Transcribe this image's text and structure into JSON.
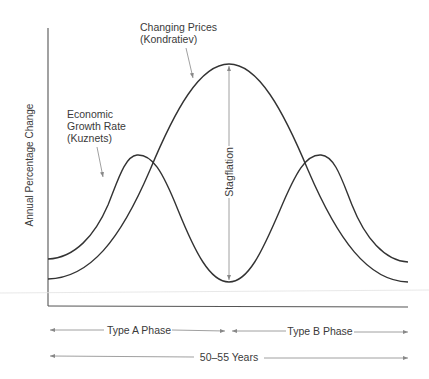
{
  "diagram": {
    "y_axis_label": "Annual Percentage Change",
    "labels": {
      "kondratiev_line1": "Changing Prices",
      "kondratiev_line2": "(Kondratiev)",
      "kuznets_line1": "Economic",
      "kuznets_line2": "Growth Rate",
      "kuznets_line3": "(Kuznets)",
      "stagflation": "Stagflation"
    },
    "phases": {
      "type_a": "Type A Phase",
      "type_b": "Type B Phase",
      "total": "50–55 Years"
    },
    "colors": {
      "curve": "#333333",
      "axis": "#555555",
      "arrow": "#888888",
      "text": "#3a3a3a"
    }
  }
}
